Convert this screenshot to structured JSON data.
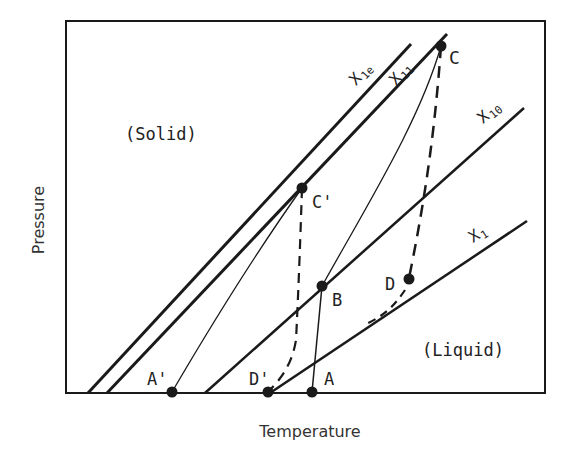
{
  "diagram": {
    "xlabel": "Temperature",
    "ylabel": "Pressure",
    "regions": {
      "solid": "(Solid)",
      "liquid": "(Liquid)"
    },
    "lines": {
      "x1e": {
        "label_main": "X",
        "label_sub": "1e"
      },
      "x11": {
        "label_main": "X",
        "label_sub": "11"
      },
      "x10": {
        "label_main": "X",
        "label_sub": "10"
      },
      "x1": {
        "label_main": "X",
        "label_sub": "1"
      }
    },
    "points": {
      "C": "C",
      "C_prime": "C'",
      "B": "B",
      "D": "D",
      "A_prime": "A'",
      "D_prime": "D'",
      "A": "A"
    },
    "colors": {
      "ink": "#1a1a1a",
      "background": "#ffffff"
    }
  }
}
